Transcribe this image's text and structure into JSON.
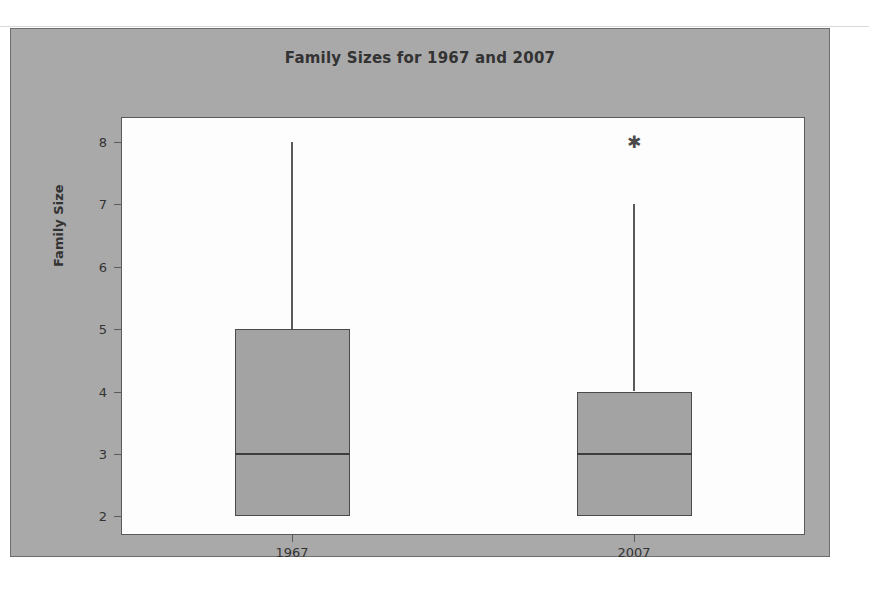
{
  "chart_data": {
    "type": "box",
    "title": "Family Sizes for 1967 and 2007",
    "xlabel": "",
    "ylabel": "Family Size",
    "ylim": [
      1.7,
      8.4
    ],
    "yticks": [
      2,
      3,
      4,
      5,
      6,
      7,
      8
    ],
    "ytick_labels": [
      "2",
      "3",
      "4",
      "5",
      "6",
      "7",
      "8"
    ],
    "grid": false,
    "legend": "none",
    "categories": [
      "1967",
      "2007"
    ],
    "boxes": [
      {
        "category": "1967",
        "lower_whisker": 2,
        "q1": 2,
        "median": 3,
        "q3": 5,
        "upper_whisker": 8,
        "outliers": []
      },
      {
        "category": "2007",
        "lower_whisker": 2,
        "q1": 2,
        "median": 3,
        "q3": 4,
        "upper_whisker": 7,
        "outliers": [
          8
        ]
      }
    ]
  },
  "style": {
    "panel_background": "#a9a9a9",
    "plot_background": "#fdfdfd",
    "box_fill": "#a3a3a3",
    "box_border": "#4a4a4a",
    "text_color": "#333333",
    "axis_color": "#5a5a5a"
  },
  "icons": {
    "outlier": "✱"
  }
}
